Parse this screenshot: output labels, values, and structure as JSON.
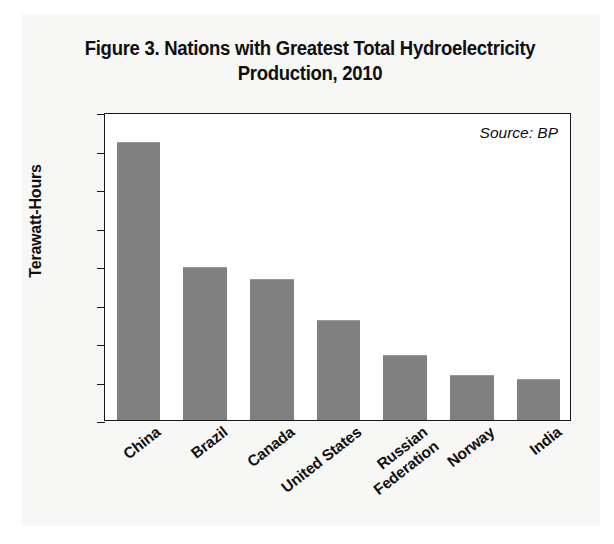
{
  "figure": {
    "title_line1": "Figure 3. Nations with Greatest Total Hydroelectricity",
    "title_line2": "Production, 2010",
    "source_note": "Source: BP"
  },
  "chart_data": {
    "type": "bar",
    "title": "Figure 3. Nations with Greatest Total Hydroelectricity Production, 2010",
    "xlabel": "",
    "ylabel": "Terawatt-Hours",
    "ylim": [
      0,
      800
    ],
    "ytick_labels": [
      "800",
      "700",
      "600",
      "500",
      "400",
      "300",
      "200",
      "100",
      "0"
    ],
    "ytick_values": [
      800,
      700,
      600,
      500,
      400,
      300,
      200,
      100,
      0
    ],
    "grid": false,
    "legend": false,
    "annotations": [
      "Source: BP"
    ],
    "bar_color": "#808080",
    "categories": [
      "China",
      "Brazil",
      "Canada",
      "United States",
      "Russian Federation",
      "Norway",
      "India"
    ],
    "category_lines": [
      [
        "China"
      ],
      [
        "Brazil"
      ],
      [
        "Canada"
      ],
      [
        "United States"
      ],
      [
        "Russian",
        "Federation"
      ],
      [
        "Norway"
      ],
      [
        "India"
      ]
    ],
    "values": [
      720,
      396,
      363,
      257,
      165,
      115,
      105
    ]
  }
}
